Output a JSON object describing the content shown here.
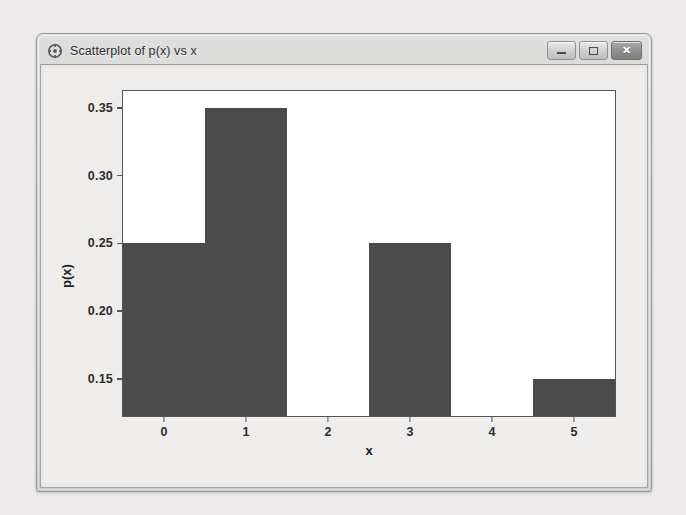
{
  "window": {
    "title": "Scatterplot of p(x) vs x",
    "icon": "scatterplot-target-icon",
    "buttons": {
      "minimize_label": "—",
      "maximize_label": "□",
      "close_label": "✕"
    }
  },
  "chart_data": {
    "type": "bar",
    "title": "",
    "subtitle": "",
    "categories": [
      "0",
      "1",
      "2",
      "3",
      "4",
      "5"
    ],
    "values": [
      0.25,
      0.35,
      0.1,
      0.25,
      0.1,
      0.15
    ],
    "xlabel": "x",
    "ylabel": "p(x)",
    "ylim": [
      0.1225,
      0.3625
    ],
    "yticks": [
      0.15,
      0.2,
      0.25,
      0.3,
      0.35
    ],
    "ytick_labels": [
      "0.15",
      "0.20",
      "0.25",
      "0.30",
      "0.35"
    ],
    "xticks": [
      "0",
      "1",
      "2",
      "3",
      "4",
      "5"
    ],
    "grid": false,
    "legend": false,
    "legend_position": "none",
    "bar_color": "#4b4b4b",
    "plot_background": "#ffffff",
    "axis_color": "#555555",
    "note": "Bars for x=2 and x=4 sit at or below the visible y-axis floor, so no bar body is drawn above the baseline."
  },
  "colors": {
    "window_chrome": "#d2d2d1",
    "client_background": "#e9e8e7",
    "page_background": "#eceaea",
    "accent": "#4b4b4b",
    "close_button": "#8f8f8e"
  }
}
